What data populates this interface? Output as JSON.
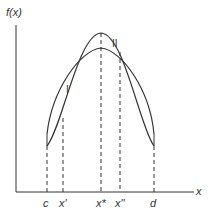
{
  "diagram": {
    "y_axis_label": "f(x)",
    "x_axis_label": "x",
    "x_ticks": [
      {
        "label": "c",
        "x": 47
      },
      {
        "label": "x'",
        "x": 63
      },
      {
        "label": "x*",
        "x": 101
      },
      {
        "label": "x''",
        "x": 120
      },
      {
        "label": "d",
        "x": 154
      }
    ],
    "curves": [
      {
        "name": "I",
        "description": "wider, flatter curve"
      },
      {
        "name": "II",
        "description": "narrower, taller curve"
      }
    ],
    "colors": {
      "line": "#333333",
      "background": "#ffffff"
    }
  }
}
